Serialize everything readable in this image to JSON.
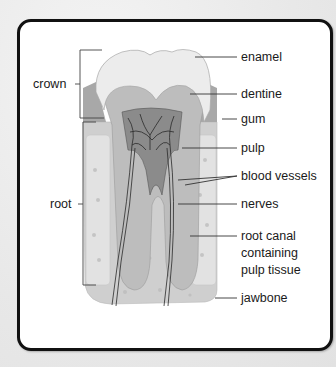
{
  "diagram": {
    "left_labels": [
      {
        "id": "crown",
        "text": "crown"
      },
      {
        "id": "root",
        "text": "root"
      }
    ],
    "right_labels": [
      {
        "id": "enamel",
        "text": "enamel"
      },
      {
        "id": "dentine",
        "text": "dentine"
      },
      {
        "id": "gum",
        "text": "gum"
      },
      {
        "id": "pulp",
        "text": "pulp"
      },
      {
        "id": "blood-vessels",
        "text": "blood vessels"
      },
      {
        "id": "nerves",
        "text": "nerves"
      },
      {
        "id": "root-canal",
        "lines": [
          "root canal",
          "containing",
          "pulp tissue"
        ]
      },
      {
        "id": "jawbone",
        "text": "jawbone"
      }
    ],
    "colors": {
      "frame_border": "#111111",
      "enamel": "#ededed",
      "dentine": "#bdbdbd",
      "pulp": "#8a8a8a",
      "gum": "#a9a9a9",
      "jawbone": "#d0d0d0",
      "bone_inner": "#e0e0e0",
      "vessels": "#2a2a2a"
    }
  }
}
